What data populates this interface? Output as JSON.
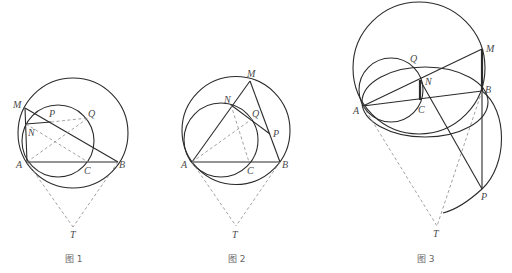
{
  "figures": [
    {
      "caption": "图 1",
      "labels": {
        "M": "M",
        "N": "N",
        "P": "P",
        "Q": "Q",
        "A": "A",
        "C": "C",
        "B": "B",
        "T": "T"
      }
    },
    {
      "caption": "图 2",
      "labels": {
        "M": "M",
        "N": "N",
        "Q": "Q",
        "P": "P",
        "A": "A",
        "C": "C",
        "B": "B",
        "T": "T"
      }
    },
    {
      "caption": "图 3",
      "labels": {
        "M": "M",
        "Q": "Q",
        "N": "N",
        "B": "B",
        "A": "A",
        "C": "C",
        "P": "P",
        "T": "T"
      }
    }
  ],
  "colors": {
    "stroke": "#2b2b2b",
    "dashed": "#8a8a8a",
    "label": "#4a4a4a"
  }
}
